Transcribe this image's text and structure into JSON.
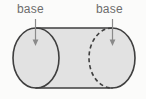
{
  "figure": {
    "name": "cylinder-with-labeled-bases",
    "shape": "cylinder",
    "background_color": "#fbfbfa",
    "labels": [
      {
        "id": "left",
        "text": "base",
        "color": "#6d6d6d"
      },
      {
        "id": "right",
        "text": "base",
        "color": "#6d6d6d"
      }
    ],
    "annotations": {
      "arrow_left_name": "arrow-down-to-left-base",
      "arrow_right_name": "arrow-down-to-right-base",
      "arrow_color": "#8a8a8a"
    },
    "geometry": {
      "stroke_color": "#3f3f3f",
      "fill_color": "#e2e2e2",
      "stroke_width": 1.6,
      "left_base_style": "solid",
      "right_base_front_style": "solid",
      "right_base_hidden_style": "dashed",
      "dash_pattern": "4 3",
      "left_ellipse_center_x": 36,
      "right_ellipse_center_x": 112,
      "ellipse_center_y": 58,
      "ellipse_rx": 23,
      "ellipse_ry": 30,
      "top_edge_y": 28,
      "bottom_edge_y": 88
    }
  }
}
